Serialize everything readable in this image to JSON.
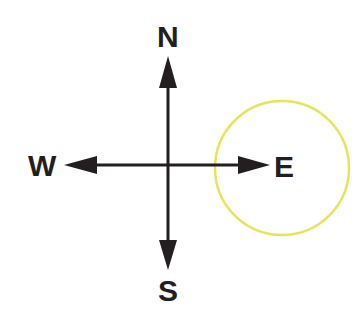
{
  "diagram": {
    "type": "compass",
    "directions": {
      "north": "N",
      "south": "S",
      "west": "W",
      "east": "E"
    },
    "highlight": {
      "target": "east",
      "shape": "circle",
      "color": "#e8e45a"
    },
    "colors": {
      "arrows": "#231f20",
      "labels": "#231f20",
      "background": "#ffffff"
    }
  }
}
